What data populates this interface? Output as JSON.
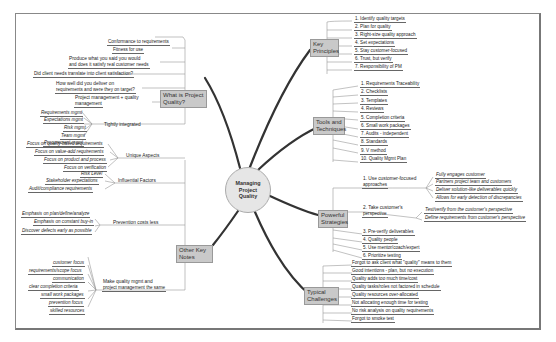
{
  "center": {
    "label_1": "Managing",
    "label_2": "Project",
    "label_3": "Quality"
  },
  "colors": {
    "branch_box": "#c9c9c9",
    "center_fill": "#e6e6e6",
    "thick_line": "#333333",
    "thin_line": "#999999"
  },
  "what_is_quality": {
    "title_1": "What is Project",
    "title_2": "Quality?",
    "items": [
      "Conformance to requirements",
      "Fitness for use",
      "Produce what you said you would",
      "and does it satisfy real customer needs",
      "Did client needs translate into client satisfaction?",
      "How well did you deliver on",
      "requirements and were they on target?",
      "Project management + quality",
      "management"
    ],
    "tightly": {
      "label": "Tightly integrated",
      "items": [
        "Requirements mgmt",
        "Expectations mgmt",
        "Risk mgmt",
        "Team mgmt",
        "Procurement mgmt"
      ]
    }
  },
  "other_notes": {
    "title_1": "Other Key",
    "title_2": "Notes",
    "unique": {
      "label": "Unique Aspects",
      "items": [
        "Focus on quality-based requirements",
        "Focus on value-add requirements",
        "Focus on product and process",
        "Focus on verification"
      ]
    },
    "influential": {
      "label": "Influential Factors",
      "items": [
        "Risk Level",
        "Stakeholder expectations",
        "Audit/compliance requirements"
      ]
    },
    "prevention": {
      "label": "Prevention costs less",
      "items": [
        "Emphasis on plan/define/analyze",
        "Emphasis on constant buy-in",
        "Discover defects early as possible"
      ]
    },
    "make_same": {
      "label_1": "Make quality mgmt and",
      "label_2": "project management the same",
      "items": [
        "customer focus",
        "requirements/scope focus",
        "communication",
        "clear completion criteria",
        "small work packages",
        "prevention focus",
        "skilled resources"
      ]
    }
  },
  "key_principles": {
    "title_1": "Key",
    "title_2": "Principles",
    "items": [
      "1. Identify quality targets",
      "2. Plan for quality",
      "3. Right-size quality approach",
      "4. Set expectations",
      "5. Stay customer-focused",
      "6. Trust, but verify",
      "7. Responsibility of PM"
    ]
  },
  "tools": {
    "title_1": "Tools and",
    "title_2": "Techniques",
    "items": [
      "1. Requirements Traceability",
      "2. Checklists",
      "3. Templates",
      "4. Reviews",
      "5. Completion criteria",
      "6. Small work packages",
      "7. Audits - independent",
      "8. Standards",
      "9. V method",
      "10. Quality Mgmt Plan"
    ]
  },
  "strategies": {
    "title_1": "Powerful",
    "title_2": "Strategies",
    "s1": {
      "label_1": "1. Use customer-focused",
      "label_2": "approaches",
      "items": [
        "Fully engages customer",
        "Partners project team and customers",
        "Deliver solution-like deliverables quickly",
        "Allows for early detection of discrepancies"
      ]
    },
    "s2": {
      "label_1": "2. Take customer's",
      "label_2": "perspective",
      "items": [
        "Test/verify from the customer's perspective",
        "Define requirements from customer's perspective"
      ]
    },
    "items": [
      "3. Pre-verify deliverables",
      "4. Quality people",
      "5. Use mentor/coach/expert",
      "6. Prioritize testing"
    ]
  },
  "challenges": {
    "title_1": "Typical",
    "title_2": "Challenges",
    "items": [
      "Forgot to ask client what \"quality\" means to them",
      "Good intentions - plan, but no execution",
      "Quality adds too much time/cost",
      "Quality tasks/roles not factored in schedule",
      "Quality resources over-allocated",
      "Not allocating enough time for testing",
      "No risk analysis on quality requirements",
      "Forgot to smoke test"
    ]
  }
}
